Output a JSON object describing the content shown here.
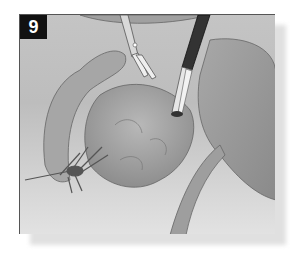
{
  "figure": {
    "step_number": "9",
    "colors": {
      "badge_bg": "#111111",
      "badge_text": "#ffffff",
      "frame_border": "#555555",
      "background": "#c4c4c4",
      "shadow": "#e0e0e0"
    }
  }
}
